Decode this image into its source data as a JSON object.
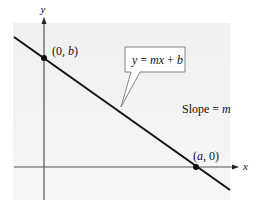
{
  "diagram": {
    "type": "line-graph",
    "axes": {
      "x_label": "x",
      "y_label": "y"
    },
    "line": {
      "equation_label": "y = mx + b",
      "equation_parts": {
        "lhs": "y",
        "eq": " = ",
        "m": "m",
        "x": "x",
        "plus": " + ",
        "b": "b"
      },
      "slope_label_prefix": "Slope = ",
      "slope_symbol": "m"
    },
    "points": [
      {
        "label": "(0, b)",
        "open": "(0, ",
        "var": "b",
        "close": ")"
      },
      {
        "label": "(a, 0)",
        "open": "(",
        "var": "a",
        "close": ", 0)"
      }
    ],
    "colors": {
      "line": "#111111",
      "axis": "#555555",
      "panel": "#f3f3f3",
      "callout_border": "#777777"
    }
  }
}
